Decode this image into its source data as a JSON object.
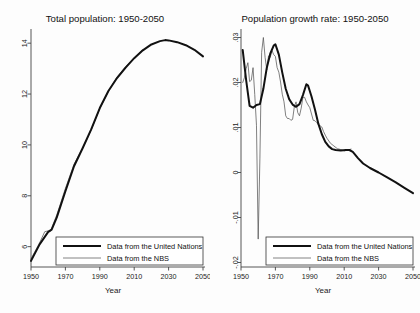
{
  "figure": {
    "axis_title": "Year",
    "legend": {
      "un_label": "Data from the United Nations",
      "nbs_label": "Data from the NBS"
    },
    "colors": {
      "un_line": "#111111",
      "nbs_line": "#555555",
      "axis": "#444444",
      "background": "#fdfdfd"
    }
  },
  "chart_data": [
    {
      "type": "line",
      "id": "total-population",
      "title": "Total population: 1950-2050",
      "xlabel": "Year",
      "ylabel": "",
      "xlim": [
        1950,
        2050
      ],
      "ylim": [
        5.2,
        14.4
      ],
      "xticks": [
        1950,
        1970,
        1990,
        2010,
        2030,
        2050
      ],
      "xtick_labels": [
        "1950",
        "1970",
        "1990",
        "2010",
        "2030",
        "2050"
      ],
      "yticks": [
        6,
        8,
        10,
        12,
        14
      ],
      "ytick_labels": [
        "6",
        "8",
        "10",
        "12",
        "14"
      ],
      "grid": false,
      "legend_position": "bottom-left",
      "units": "hundred million persons",
      "series": [
        {
          "name": "Data from the United Nations",
          "style": "thick",
          "x": [
            1950,
            1955,
            1960,
            1962,
            1965,
            1970,
            1975,
            1980,
            1985,
            1990,
            1995,
            2000,
            2005,
            2010,
            2015,
            2020,
            2025,
            2028,
            2030,
            2035,
            2040,
            2045,
            2050
          ],
          "values": [
            5.44,
            6.09,
            6.58,
            6.67,
            7.15,
            8.18,
            9.16,
            9.87,
            10.61,
            11.45,
            12.12,
            12.63,
            13.04,
            13.41,
            13.72,
            13.95,
            14.08,
            14.12,
            14.11,
            14.04,
            13.92,
            13.74,
            13.48
          ]
        },
        {
          "name": "Data from the NBS",
          "style": "thin",
          "x": [
            1950,
            1955,
            1958,
            1960,
            1961,
            1962,
            1965,
            1970,
            1975,
            1980,
            1985,
            1990,
            1995,
            2000,
            2005,
            2010,
            2015
          ],
          "values": [
            5.52,
            6.15,
            6.59,
            6.62,
            6.58,
            6.73,
            7.25,
            8.29,
            9.24,
            9.87,
            10.59,
            11.43,
            12.11,
            12.67,
            13.08,
            13.41,
            13.75
          ]
        }
      ]
    },
    {
      "type": "line",
      "id": "population-growth-rate",
      "title": "Population growth rate: 1950-2050",
      "xlabel": "Year",
      "ylabel": "",
      "xlim": [
        1950,
        2050
      ],
      "ylim": [
        -0.021,
        0.031
      ],
      "xticks": [
        1950,
        1970,
        1990,
        2010,
        2030,
        2050
      ],
      "xtick_labels": [
        "1950",
        "1970",
        "1990",
        "2010",
        "2030",
        "2050"
      ],
      "yticks": [
        0.03,
        0.02,
        0.01,
        0,
        -0.01,
        -0.02
      ],
      "ytick_labels": [
        ".03",
        ".02",
        ".01",
        "0",
        "-.01",
        "-.02"
      ],
      "grid": false,
      "legend_position": "bottom-left",
      "units": "annual rate",
      "series": [
        {
          "name": "Data from the United Nations",
          "style": "thick",
          "x": [
            1951,
            1953,
            1955,
            1957,
            1959,
            1961,
            1963,
            1965,
            1967,
            1969,
            1970,
            1972,
            1974,
            1976,
            1978,
            1980,
            1982,
            1984,
            1986,
            1988,
            1989,
            1991,
            1993,
            1995,
            1997,
            1999,
            2001,
            2003,
            2005,
            2008,
            2011,
            2013,
            2015,
            2018,
            2021,
            2025,
            2030,
            2035,
            2040,
            2045,
            2050
          ],
          "values": [
            0.0272,
            0.0205,
            0.0148,
            0.0144,
            0.015,
            0.0152,
            0.0186,
            0.0233,
            0.0264,
            0.0282,
            0.0285,
            0.0262,
            0.0222,
            0.0186,
            0.0163,
            0.0151,
            0.0146,
            0.0152,
            0.0172,
            0.0196,
            0.0193,
            0.0169,
            0.014,
            0.0108,
            0.0085,
            0.0068,
            0.0058,
            0.0052,
            0.005,
            0.0049,
            0.005,
            0.005,
            0.0046,
            0.0032,
            0.002,
            0.001,
            0.0,
            -0.0011,
            -0.0022,
            -0.0034,
            -0.0046
          ]
        },
        {
          "name": "Data from the NBS",
          "style": "thin",
          "x": [
            1951,
            1952,
            1953,
            1954,
            1955,
            1956,
            1957,
            1958,
            1959,
            1960,
            1961,
            1962,
            1963,
            1964,
            1965,
            1966,
            1967,
            1968,
            1969,
            1970,
            1971,
            1972,
            1973,
            1974,
            1975,
            1976,
            1977,
            1978,
            1979,
            1980,
            1981,
            1982,
            1983,
            1984,
            1985,
            1986,
            1987,
            1988,
            1989,
            1990,
            1991,
            1992,
            1993,
            1994,
            1995,
            1996,
            1997,
            1998,
            1999,
            2000,
            2002,
            2004,
            2006,
            2008,
            2010,
            2012,
            2014
          ],
          "values": [
            0.02,
            0.0211,
            0.0231,
            0.0244,
            0.0202,
            0.0205,
            0.0233,
            0.0173,
            0.0105,
            -0.0148,
            0.0032,
            0.0267,
            0.03,
            0.0256,
            0.0228,
            0.0259,
            0.0256,
            0.0271,
            0.0262,
            0.0258,
            0.0233,
            0.0223,
            0.0201,
            0.0174,
            0.0157,
            0.0126,
            0.012,
            0.012,
            0.0116,
            0.0118,
            0.0146,
            0.0157,
            0.0133,
            0.0126,
            0.0143,
            0.0167,
            0.0167,
            0.0157,
            0.015,
            0.0144,
            0.013,
            0.0116,
            0.0115,
            0.0111,
            0.0106,
            0.0104,
            0.0101,
            0.0091,
            0.0083,
            0.0076,
            0.0065,
            0.0059,
            0.0053,
            0.0051,
            0.0048,
            0.005,
            0.0052
          ]
        }
      ]
    }
  ]
}
